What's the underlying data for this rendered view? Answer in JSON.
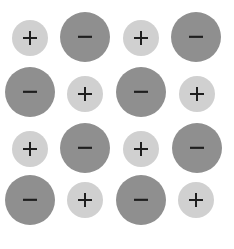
{
  "diagram": {
    "title": "",
    "type": "ionic-crystal-lattice",
    "rows": 4,
    "cols": 4,
    "legend": {
      "cation": {
        "symbol": "+",
        "fill": "#d0d0d0",
        "size": "small"
      },
      "anion": {
        "symbol": "−",
        "fill": "#8f8f8f",
        "size": "large"
      }
    },
    "colors": {
      "background": "#ffffff",
      "cation_fill": "#d0d0d0",
      "anion_fill": "#8f8f8f",
      "sign_color": "#1e1e1e"
    },
    "ions": [
      {
        "row": 0,
        "col": 0,
        "type": "cation",
        "symbol": "+",
        "cx": 30,
        "cy": 38
      },
      {
        "row": 0,
        "col": 1,
        "type": "anion",
        "symbol": "−",
        "cx": 85,
        "cy": 37
      },
      {
        "row": 0,
        "col": 2,
        "type": "cation",
        "symbol": "+",
        "cx": 141,
        "cy": 38
      },
      {
        "row": 0,
        "col": 3,
        "type": "anion",
        "symbol": "−",
        "cx": 196,
        "cy": 37
      },
      {
        "row": 1,
        "col": 0,
        "type": "anion",
        "symbol": "−",
        "cx": 30,
        "cy": 92
      },
      {
        "row": 1,
        "col": 1,
        "type": "cation",
        "symbol": "+",
        "cx": 85,
        "cy": 94
      },
      {
        "row": 1,
        "col": 2,
        "type": "anion",
        "symbol": "−",
        "cx": 141,
        "cy": 92
      },
      {
        "row": 1,
        "col": 3,
        "type": "cation",
        "symbol": "+",
        "cx": 197,
        "cy": 94
      },
      {
        "row": 2,
        "col": 0,
        "type": "cation",
        "symbol": "+",
        "cx": 30,
        "cy": 149
      },
      {
        "row": 2,
        "col": 1,
        "type": "anion",
        "symbol": "−",
        "cx": 85,
        "cy": 148
      },
      {
        "row": 2,
        "col": 2,
        "type": "cation",
        "symbol": "+",
        "cx": 141,
        "cy": 149
      },
      {
        "row": 2,
        "col": 3,
        "type": "anion",
        "symbol": "−",
        "cx": 197,
        "cy": 148
      },
      {
        "row": 3,
        "col": 0,
        "type": "anion",
        "symbol": "−",
        "cx": 30,
        "cy": 200
      },
      {
        "row": 3,
        "col": 1,
        "type": "cation",
        "symbol": "+",
        "cx": 85,
        "cy": 200
      },
      {
        "row": 3,
        "col": 2,
        "type": "anion",
        "symbol": "−",
        "cx": 141,
        "cy": 200
      },
      {
        "row": 3,
        "col": 3,
        "type": "cation",
        "symbol": "+",
        "cx": 196,
        "cy": 200
      }
    ]
  }
}
